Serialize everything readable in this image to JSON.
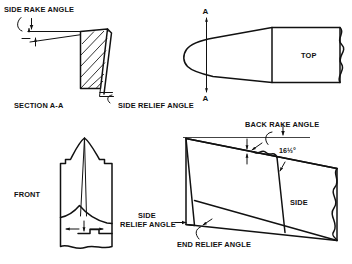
{
  "diagram": {
    "background_color": "#ffffff",
    "line_color": "#111111"
  },
  "views": {
    "section": {
      "name": "SECTION A-A",
      "label": "SECTION A-A"
    },
    "top": {
      "name": "TOP",
      "label": "TOP"
    },
    "front": {
      "name": "FRONT",
      "label": "FRONT"
    },
    "side": {
      "name": "SIDE",
      "label": "SIDE"
    }
  },
  "annotations": {
    "side_rake_angle": "SIDE RAKE ANGLE",
    "side_relief_angle_top": "SIDE RELIEF ANGLE",
    "back_rake_angle": "BACK RAKE ANGLE",
    "side_relief_angle_line1": "SIDE",
    "side_relief_angle_line2": "RELIEF ANGLE",
    "end_relief_angle": "END RELIEF ANGLE",
    "back_rake_value": "16½°"
  },
  "section_marks": {
    "top_letter": "A",
    "bottom_letter": "A"
  }
}
